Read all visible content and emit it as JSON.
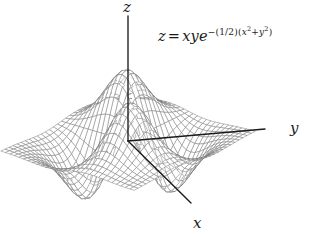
{
  "figure": {
    "kind": "3d-surface-wireframe",
    "background_color": "#ffffff",
    "mesh_color": "#7a7a7a",
    "axis_color": "#1a1a1a",
    "equation_plain": "z = xye^-(1/2)(x^2 + y^2)",
    "equation_parts": {
      "lhs": "z",
      "equals": "=",
      "base": "xye",
      "exp_sign": "−",
      "exp_coefficient": "(1/2)",
      "exp_group_open": "(",
      "exp_x": "x",
      "exp_x_pow": "2",
      "exp_plus": "+",
      "exp_y": "y",
      "exp_y_pow": "2",
      "exp_group_close": ")"
    },
    "axes": [
      {
        "name": "z",
        "label": "z",
        "label_x": 123,
        "label_y": 12
      },
      {
        "name": "y",
        "label": "y",
        "label_x": 290,
        "label_y": 133
      },
      {
        "name": "x",
        "label": "x",
        "label_x": 193,
        "label_y": 228
      }
    ]
  },
  "chart_data": {
    "type": "surface",
    "title": "",
    "equation": "z = xy e^{-(1/2)(x^2 + y^2)}",
    "xlabel": "x",
    "ylabel": "y",
    "zlabel": "z",
    "xlim": [
      -3,
      3
    ],
    "ylim": [
      -3,
      3
    ],
    "zlim": [
      -0.4,
      0.4
    ],
    "grid": false,
    "legend": false,
    "mesh_steps": 30,
    "critical_points": [
      {
        "x": 1,
        "y": 1,
        "z": 0.3679,
        "type": "maximum"
      },
      {
        "x": -1,
        "y": -1,
        "z": 0.3679,
        "type": "maximum"
      },
      {
        "x": 1,
        "y": -1,
        "z": -0.3679,
        "type": "minimum"
      },
      {
        "x": -1,
        "y": 1,
        "z": -0.3679,
        "type": "minimum"
      },
      {
        "x": 0,
        "y": 0,
        "z": 0,
        "type": "saddle"
      }
    ],
    "projection": {
      "elevation_deg": 22,
      "azimuth_deg": 35,
      "origin_px": [
        128,
        141
      ],
      "z_axis_top_px": [
        128,
        16
      ],
      "y_axis_end_px": [
        265,
        129
      ],
      "x_axis_end_px": [
        191,
        203
      ]
    }
  }
}
